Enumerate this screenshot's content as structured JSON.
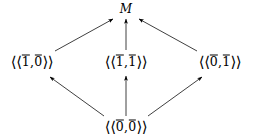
{
  "diagram": {
    "type": "commutative-diagram",
    "background_color": "#ffffff",
    "line_color": "#000000",
    "nodes": [
      {
        "id": "top",
        "label": "M",
        "kind": "italic-variable",
        "x": 126,
        "y": 9
      },
      {
        "id": "left",
        "label": "⟨⟨1̄,0̄⟩⟩",
        "kind": "double-angle-pair",
        "open": "⟨⟨",
        "close": "⟩⟩",
        "first": "1",
        "second": "0",
        "x": 32,
        "y": 62
      },
      {
        "id": "middle",
        "label": "⟨⟨1̄,1̄⟩⟩",
        "kind": "double-angle-pair",
        "open": "⟨⟨",
        "close": "⟩⟩",
        "first": "1",
        "second": "1",
        "x": 126,
        "y": 62
      },
      {
        "id": "right",
        "label": "⟨⟨0̄,1̄⟩⟩",
        "kind": "double-angle-pair",
        "open": "⟨⟨",
        "close": "⟩⟩",
        "first": "0",
        "second": "1",
        "x": 220,
        "y": 62
      },
      {
        "id": "bottom",
        "label": "⟨⟨0̄,0̄⟩⟩",
        "kind": "double-angle-pair",
        "open": "⟨⟨",
        "close": "⟩⟩",
        "first": "0",
        "second": "0",
        "x": 126,
        "y": 127
      }
    ],
    "edges": [
      {
        "id": "left-to-top",
        "from": "left",
        "to": "top",
        "style": "arrow"
      },
      {
        "id": "middle-to-top",
        "from": "middle",
        "to": "top",
        "style": "arrow"
      },
      {
        "id": "right-to-top",
        "from": "right",
        "to": "top",
        "style": "arrow"
      },
      {
        "id": "bottom-to-left",
        "from": "bottom",
        "to": "left",
        "style": "arrow"
      },
      {
        "id": "bottom-to-middle",
        "from": "bottom",
        "to": "middle",
        "style": "arrow"
      },
      {
        "id": "bottom-to-right",
        "from": "bottom",
        "to": "right",
        "style": "arrow"
      }
    ]
  }
}
